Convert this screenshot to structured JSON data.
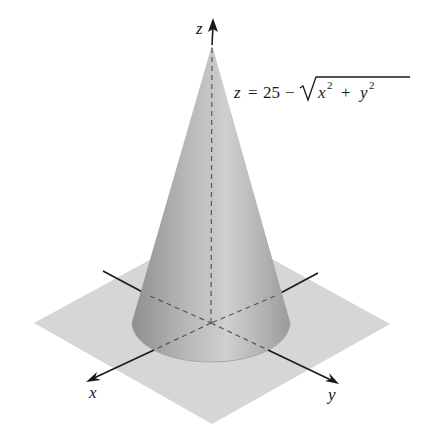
{
  "figure": {
    "equation": {
      "lhs": "z",
      "equals": "=",
      "constant": "25",
      "minus": "−",
      "radicand_x": "x",
      "radicand_x_exp": "2",
      "plus": "+",
      "radicand_y": "y",
      "radicand_y_exp": "2"
    },
    "axes": {
      "x_label": "x",
      "y_label": "y",
      "z_label": "z"
    },
    "colors": {
      "plane": "#d4d4d4",
      "cone_light": "#d0d0d0",
      "cone_dark": "#8e8e8e",
      "axis": "#1a1a1a",
      "dashed": "#555555"
    }
  }
}
